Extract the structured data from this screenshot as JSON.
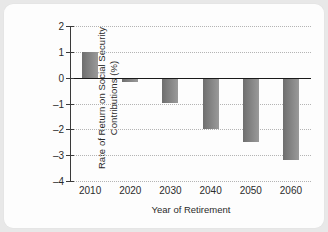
{
  "chart_data": {
    "type": "bar",
    "title": "",
    "xlabel": "Year of Retirement",
    "ylabel": "Rate of Return on Social Security Contributions (%)",
    "ylabel_lines": [
      "Rate of Return on Social Security",
      "Contributions (%)"
    ],
    "categories": [
      "2010",
      "2020",
      "2030",
      "2040",
      "2050",
      "2060"
    ],
    "values": [
      1.0,
      -0.15,
      -1.0,
      -2.0,
      -2.5,
      -3.2
    ],
    "ylim": [
      -4,
      2
    ],
    "yticks": [
      2,
      1,
      0,
      -1,
      -2,
      -3,
      -4
    ],
    "ytick_labels": [
      "2",
      "1",
      "0",
      "–1",
      "–2",
      "–3",
      "–4"
    ],
    "grid": "horizontal-dotted",
    "legend": "none",
    "zero_line": true,
    "bar_color": "#7f7f7f",
    "grid_color": "#b4b4b4",
    "axis_color": "#3a3a3a"
  }
}
